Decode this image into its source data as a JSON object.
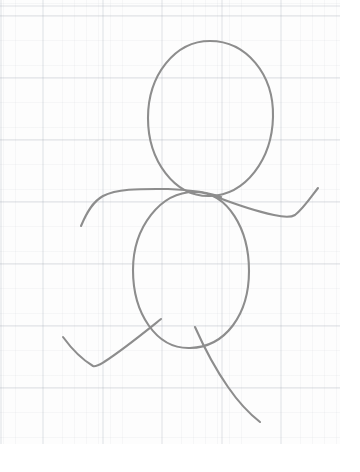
{
  "canvas": {
    "width": 360,
    "height": 472,
    "background_color": "#ffffff",
    "paper_color": "#fdfdfd",
    "title": "Hand-drawn figure sketch on graph paper"
  },
  "paper": {
    "name": "graph-paper-sheet",
    "width": 340,
    "height": 444,
    "grid_minor_color": "#eceef1",
    "grid_major_color": "#e1e4e9",
    "grid_minor_spacing_px": 12,
    "grid_major_spacing_x_px": 60,
    "grid_major_spacing_y_px": 62,
    "grid_origin_x_px": 42,
    "grid_origin_y_px": 15
  },
  "drawing": {
    "name": "stick-figure-sketch",
    "subject": "person",
    "medium": "pencil",
    "stroke_color": "#8d8d8d",
    "stroke_color_light": "#a6a6a6",
    "stroke_width": 2.1,
    "parts": [
      {
        "name": "head-ellipse",
        "type": "ellipse",
        "cx": 210,
        "cy": 119,
        "rx": 63,
        "ry": 78,
        "rotation_deg": 4,
        "path": "M 210 41 C 246 41 274 74 273 117 C 272 159 246 195 210 196 C 174 197 148 160 148 118 C 148 75 175 41 210 41 Z"
      },
      {
        "name": "body-ellipse",
        "type": "ellipse",
        "cx": 191,
        "cy": 270,
        "rx": 58,
        "ry": 78,
        "rotation_deg": -2,
        "path": "M 196 192 C 228 193 249 229 249 271 C 249 314 226 347 190 348 C 156 349 133 313 133 270 C 133 228 160 191 196 192 Z"
      },
      {
        "name": "left-arm",
        "type": "stroke",
        "path": "M 81 226 C 86 214 92 202 103 196 C 118 188 144 189 168 189 C 190 190 208 192 221 197"
      },
      {
        "name": "right-arm",
        "type": "stroke",
        "path": "M 214 196 C 232 203 255 211 274 215 C 283 217 290 218 295 215 C 303 209 311 197 318 188"
      },
      {
        "name": "left-leg",
        "type": "stroke",
        "path": "M 161 319 C 146 331 124 349 104 362 C 99 365 96 367 93 366 C 83 360 71 348 63 337"
      },
      {
        "name": "right-leg",
        "type": "stroke",
        "path": "M 195 327 C 203 345 214 367 228 387 C 239 403 251 415 260 422"
      }
    ]
  }
}
